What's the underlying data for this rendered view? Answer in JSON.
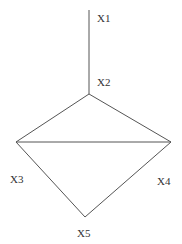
{
  "diagram": {
    "type": "graph",
    "nodes": [
      {
        "id": "X1",
        "label": "X1",
        "x": 89,
        "y": 10,
        "label_x": 97,
        "label_y": 22
      },
      {
        "id": "X2",
        "label": "X2",
        "x": 89,
        "y": 94,
        "label_x": 97,
        "label_y": 86
      },
      {
        "id": "X3",
        "label": "X3",
        "x": 16,
        "y": 142,
        "label_x": 10,
        "label_y": 183
      },
      {
        "id": "X4",
        "label": "X4",
        "x": 171,
        "y": 142,
        "label_x": 157,
        "label_y": 185
      },
      {
        "id": "X5",
        "label": "X5",
        "x": 85,
        "y": 217,
        "label_x": 77,
        "label_y": 237
      }
    ],
    "edges": [
      {
        "from": "X1",
        "to": "X2"
      },
      {
        "from": "X2",
        "to": "X3"
      },
      {
        "from": "X2",
        "to": "X4"
      },
      {
        "from": "X3",
        "to": "X4"
      },
      {
        "from": "X3",
        "to": "X5"
      },
      {
        "from": "X4",
        "to": "X5"
      }
    ],
    "colors": {
      "edge": "#555555",
      "label": "#333333",
      "background": "#ffffff"
    }
  }
}
